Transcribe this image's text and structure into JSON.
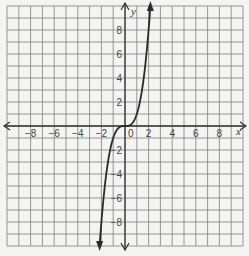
{
  "chart_data": {
    "type": "line",
    "title": "",
    "xlabel": "x",
    "ylabel": "y",
    "xlim": [
      -10,
      10
    ],
    "ylim": [
      -10,
      10
    ],
    "grid": true,
    "grid_step": 1,
    "x_ticks": [
      -8,
      -6,
      -4,
      -2,
      0,
      2,
      4,
      6,
      8
    ],
    "y_ticks": [
      -8,
      -6,
      -4,
      -2,
      2,
      4,
      6,
      8
    ],
    "tick_labels": {
      "x": [
        "-8",
        "-6",
        "-4",
        "-2",
        "0",
        "2",
        "4",
        "6",
        "8"
      ],
      "y": [
        "8",
        "6",
        "4",
        "2",
        "-2",
        "-4",
        "-6",
        "-8"
      ]
    },
    "series": [
      {
        "name": "y = x^3",
        "function": "x^3",
        "points": [
          {
            "x": -2.15,
            "y": -10
          },
          {
            "x": -2,
            "y": -8
          },
          {
            "x": -1.5,
            "y": -3.4
          },
          {
            "x": -1,
            "y": -1
          },
          {
            "x": -0.5,
            "y": -0.1
          },
          {
            "x": 0,
            "y": 0
          },
          {
            "x": 0.5,
            "y": 0.1
          },
          {
            "x": 1,
            "y": 1
          },
          {
            "x": 1.5,
            "y": 3.4
          },
          {
            "x": 2,
            "y": 8
          },
          {
            "x": 2.15,
            "y": 10
          }
        ],
        "arrows_at_ends": true
      }
    ]
  },
  "colors": {
    "background": "#f4f4f2",
    "grid": "#8a8a8a",
    "axis": "#333333",
    "curve": "#2a2a2a"
  }
}
